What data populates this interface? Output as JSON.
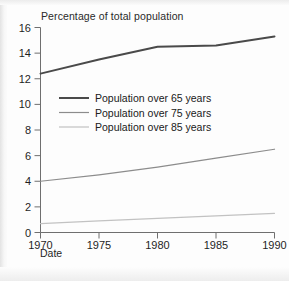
{
  "chart_data": {
    "type": "line",
    "title": "Percentage of total population",
    "xlabel": "Date",
    "ylabel": "",
    "x": [
      1970,
      1975,
      1980,
      1985,
      1990
    ],
    "xtick_labels": [
      "1970",
      "1975",
      "1980",
      "1985",
      "1990"
    ],
    "ytick_labels": [
      "0",
      "2",
      "4",
      "6",
      "8",
      "10",
      "12",
      "14",
      "16"
    ],
    "yticks": [
      0,
      2,
      4,
      6,
      8,
      10,
      12,
      14,
      16
    ],
    "xlim": [
      1970,
      1990
    ],
    "ylim": [
      0,
      16
    ],
    "grid": false,
    "legend_position": "upper-left-inside",
    "series": [
      {
        "name": "Population over 65 years",
        "values": [
          12.4,
          13.5,
          14.5,
          14.6,
          15.3
        ],
        "color": "#4a4a4a",
        "width": 2.0
      },
      {
        "name": "Population over 75 years",
        "values": [
          4.0,
          4.5,
          5.1,
          5.8,
          6.5
        ],
        "color": "#8c8c8c",
        "width": 1.2
      },
      {
        "name": "Population over 85 years",
        "values": [
          0.7,
          0.9,
          1.1,
          1.3,
          1.5
        ],
        "color": "#c2c2c2",
        "width": 1.2
      }
    ]
  },
  "axis": {
    "x_name": "Date",
    "y_name": ""
  },
  "colors": {
    "background": "#fdfdfd",
    "axis": "#6f6f6f",
    "text": "#1f1f1f",
    "series_65": "#4a4a4a",
    "series_75": "#8c8c8c",
    "series_85": "#c2c2c2"
  }
}
